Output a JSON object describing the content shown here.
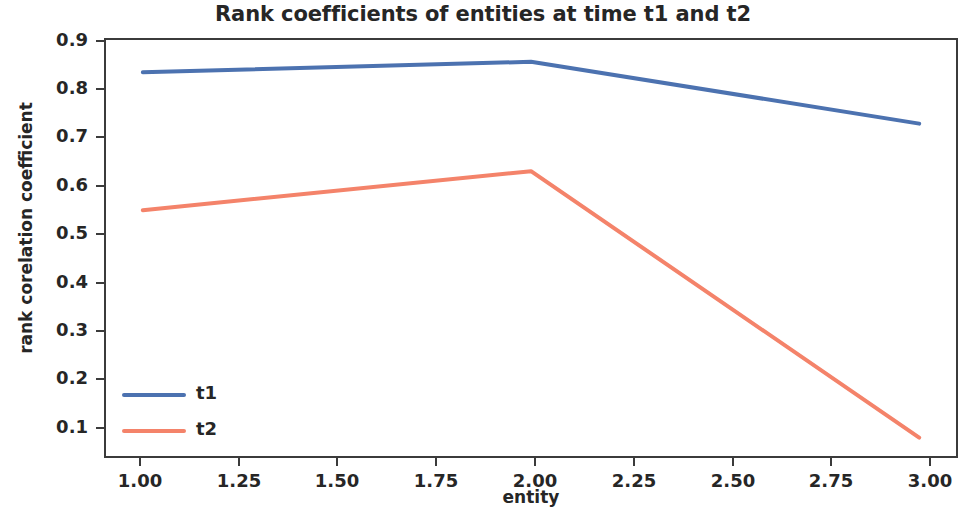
{
  "chart_data": {
    "type": "line",
    "title": "Rank coefficients of entities at time t1 and t2",
    "xlabel": "entity",
    "ylabel": "rank corelation coefficient",
    "x": [
      1.0,
      2.0,
      3.0
    ],
    "series": [
      {
        "name": "t1",
        "values": [
          0.853,
          0.875,
          0.745
        ],
        "color": "#4c72b0"
      },
      {
        "name": "t2",
        "values": [
          0.563,
          0.645,
          0.085
        ],
        "color": "#f4836a"
      }
    ],
    "xlim": [
      0.9,
      3.1
    ],
    "ylim": [
      0.042,
      0.925
    ],
    "xticks": [
      1.0,
      1.25,
      1.5,
      1.75,
      2.0,
      2.25,
      2.5,
      2.75,
      3.0
    ],
    "xtick_labels": [
      "1.00",
      "1.25",
      "1.50",
      "1.75",
      "2.00",
      "2.25",
      "2.50",
      "2.75",
      "3.00"
    ],
    "yticks": [
      0.1,
      0.2,
      0.3,
      0.4,
      0.5,
      0.6,
      0.7,
      0.8,
      0.9
    ],
    "ytick_labels": [
      "0.9",
      "0.8",
      "0.7",
      "0.6",
      "0.5",
      "0.4",
      "0.3",
      "0.2",
      "0.1"
    ],
    "grid": false,
    "legend_position": "lower left",
    "legend_frame": false
  },
  "legend": {
    "entries": [
      {
        "label": "t1",
        "color": "#4c72b0"
      },
      {
        "label": "t2",
        "color": "#f4836a"
      }
    ]
  },
  "axis": {
    "y_ticks": [
      {
        "label": "0.9",
        "y": 41
      },
      {
        "label": "0.8",
        "y": 89
      },
      {
        "label": "0.7",
        "y": 137
      },
      {
        "label": "0.6",
        "y": 186
      },
      {
        "label": "0.5",
        "y": 234
      },
      {
        "label": "0.4",
        "y": 283
      },
      {
        "label": "0.3",
        "y": 331
      },
      {
        "label": "0.2",
        "y": 379
      },
      {
        "label": "0.1",
        "y": 428
      }
    ],
    "x_ticks": [
      {
        "label": "1.00",
        "x": 140
      },
      {
        "label": "1.25",
        "x": 239
      },
      {
        "label": "1.50",
        "x": 337
      },
      {
        "label": "1.75",
        "x": 436
      },
      {
        "label": "2.00",
        "x": 535
      },
      {
        "label": "2.25",
        "x": 634
      },
      {
        "label": "2.50",
        "x": 733
      },
      {
        "label": "2.75",
        "x": 831
      },
      {
        "label": "3.00",
        "x": 930
      }
    ]
  }
}
